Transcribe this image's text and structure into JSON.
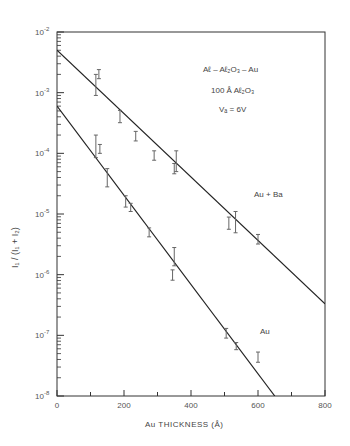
{
  "chart_data": {
    "type": "scatter",
    "title": "",
    "xlabel": "Au THICKNESS (Å)",
    "ylabel": "I1/(I1+I2)",
    "xlim": [
      0,
      800
    ],
    "ylim": [
      1e-08,
      0.01
    ],
    "yscale": "log",
    "x_ticks": [
      0,
      200,
      400,
      600,
      800
    ],
    "y_ticks": [
      "10^-2",
      "10^-3",
      "10^-4",
      "10^-5",
      "10^-6",
      "10^-7",
      "10^-8"
    ],
    "grid": false,
    "annotations": [
      "Aℓ - Aℓ2O3 - Au",
      "100 Å Aℓ2O3",
      "Va = 6V",
      "Au + Ba",
      "Au"
    ],
    "series": [
      {
        "name": "Au + Ba",
        "points": [
          {
            "x": 116,
            "y": 0.00145,
            "err_low": 0.0009,
            "err_high": 0.002
          },
          {
            "x": 125,
            "y": 0.002,
            "err_low": 0.0017,
            "err_high": 0.0024
          },
          {
            "x": 188,
            "y": 0.00041,
            "err_low": 0.00032,
            "err_high": 0.00051
          },
          {
            "x": 235,
            "y": 0.00019,
            "err_low": 0.00016,
            "err_high": 0.00023
          },
          {
            "x": 290,
            "y": 9.1e-05,
            "err_low": 7.7e-05,
            "err_high": 0.00011
          },
          {
            "x": 356,
            "y": 7.8e-05,
            "err_low": 5e-05,
            "err_high": 0.00011
          },
          {
            "x": 350,
            "y": 5.8e-05,
            "err_low": 4.6e-05,
            "err_high": 6.8e-05
          },
          {
            "x": 513,
            "y": 7.1e-06,
            "err_low": 5.6e-06,
            "err_high": 8.9e-06
          },
          {
            "x": 533,
            "y": 7.4e-06,
            "err_low": 4.9e-06,
            "err_high": 1.1e-05
          },
          {
            "x": 600,
            "y": 3.9e-06,
            "err_low": 3.2e-06,
            "err_high": 4.6e-06
          }
        ],
        "fit_line": {
          "x": [
            0,
            800
          ],
          "y": [
            0.005,
            3.3e-07
          ]
        }
      },
      {
        "name": "Au",
        "points": [
          {
            "x": 116,
            "y": 0.00013,
            "err_low": 8.5e-05,
            "err_high": 0.0002
          },
          {
            "x": 128,
            "y": 0.00012,
            "err_low": 0.0001,
            "err_high": 0.00014
          },
          {
            "x": 150,
            "y": 3.9e-05,
            "err_low": 2.8e-05,
            "err_high": 5.6e-05
          },
          {
            "x": 205,
            "y": 1.6e-05,
            "err_low": 1.3e-05,
            "err_high": 2e-05
          },
          {
            "x": 220,
            "y": 1.3e-05,
            "err_low": 1.1e-05,
            "err_high": 1.5e-05
          },
          {
            "x": 275,
            "y": 5e-06,
            "err_low": 4.2e-06,
            "err_high": 5.9e-06
          },
          {
            "x": 350,
            "y": 2e-06,
            "err_low": 1.4e-06,
            "err_high": 2.8e-06
          },
          {
            "x": 345,
            "y": 9.8e-07,
            "err_low": 8.1e-07,
            "err_high": 1.2e-06
          },
          {
            "x": 505,
            "y": 1.1e-07,
            "err_low": 9e-08,
            "err_high": 1.3e-07
          },
          {
            "x": 535,
            "y": 6.6e-08,
            "err_low": 5.8e-08,
            "err_high": 7.6e-08
          },
          {
            "x": 600,
            "y": 4.4e-08,
            "err_low": 3.6e-08,
            "err_high": 5.3e-08
          }
        ],
        "fit_line": {
          "x": [
            0,
            650
          ],
          "y": [
            0.0006,
            1e-08
          ]
        }
      }
    ]
  },
  "labels": {
    "axis_x": "Au   THICKNESS   (Å)",
    "axis_y": "I₁ / (I₁ + I₂)",
    "structure": "Aℓ – Aℓ₂O₃ – Au",
    "oxide": "100 Å  Aℓ₂O₃",
    "voltage": "Vₐ = 6V",
    "series_au_ba": "Au + Ba",
    "series_au": "Au"
  },
  "style": {
    "ink": "#333333",
    "line": "#222222",
    "errorbar": "#666666",
    "background": "#ffffff"
  }
}
